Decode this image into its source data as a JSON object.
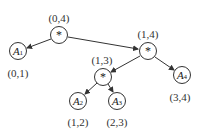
{
  "diagram": {
    "type": "binary-tree",
    "nodes": [
      {
        "id": "root",
        "symbol": "*",
        "label": "(0,4)"
      },
      {
        "id": "a1",
        "name": "A",
        "sub": "1",
        "label": "(0,1)"
      },
      {
        "id": "n14",
        "symbol": "*",
        "label": "(1,4)"
      },
      {
        "id": "n13",
        "symbol": "*",
        "label": "(1,3)"
      },
      {
        "id": "a2",
        "name": "A",
        "sub": "2",
        "label": "(1,2)"
      },
      {
        "id": "a3",
        "name": "A",
        "sub": "3",
        "label": "(2,3)"
      },
      {
        "id": "a4",
        "name": "A",
        "sub": "4",
        "label": "(3,4)"
      }
    ],
    "edges": [
      {
        "from": "root",
        "to": "a1"
      },
      {
        "from": "root",
        "to": "n14"
      },
      {
        "from": "n14",
        "to": "n13"
      },
      {
        "from": "n14",
        "to": "a4"
      },
      {
        "from": "n13",
        "to": "a2"
      },
      {
        "from": "n13",
        "to": "a3"
      }
    ]
  }
}
